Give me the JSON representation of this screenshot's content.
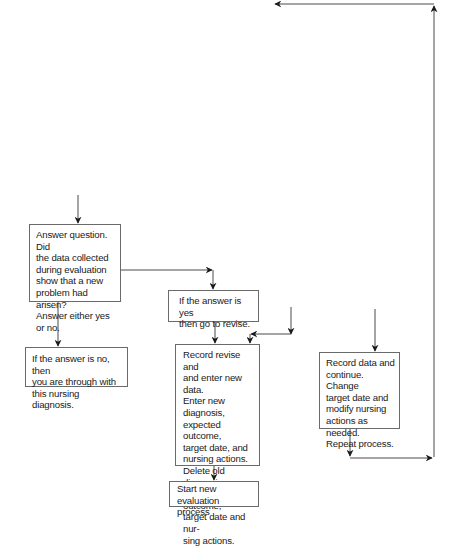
{
  "diagram": {
    "type": "flowchart",
    "colors": {
      "line": "#4a4a4a",
      "box_border": "#6a6a6a",
      "text": "#1a1a1a",
      "background": "#ffffff"
    },
    "nodes": {
      "question": "Answer question. Did\nthe data collected\nduring evaluation\nshow that a new\nproblem had arisen?\nAnswer either yes\nor no.",
      "answer_no": "If the answer is no, then\nyou are through with\nthis nursing diagnosis.",
      "answer_yes": "If the answer is yes\nthen go to revise.",
      "revise": "Record revise and\nand enter new data.\nEnter new diagnosis,\nexpected outcome,\ntarget date, and\nnursing actions.\nDelete old diagnosis,\nexpected outcome,\ntarget date and nur-\nsing actions.",
      "start_new": "Start new evaluation\nprocess",
      "continue": "Record data and\ncontinue. Change\ntarget date and\nmodify nursing\nactions as needed.\nRepeat process."
    },
    "edges": [
      {
        "from": "above",
        "to": "question"
      },
      {
        "from": "question",
        "to": "answer_no"
      },
      {
        "from": "question",
        "to": "answer_yes"
      },
      {
        "from": "answer_yes",
        "to": "revise"
      },
      {
        "from": "above",
        "to": "revise"
      },
      {
        "from": "revise",
        "to": "start_new"
      },
      {
        "from": "above",
        "to": "continue"
      },
      {
        "from": "continue",
        "to": "loop_back_top"
      }
    ]
  }
}
